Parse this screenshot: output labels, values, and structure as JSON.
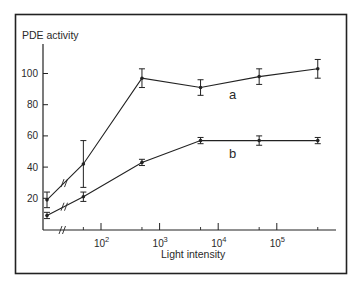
{
  "chart_data": {
    "type": "line",
    "title": "",
    "xlabel": "Light intensity",
    "ylabel": "PDE activity",
    "x_scale": "log (with axis break near origin)",
    "x_tick_labels": [
      "10",
      "10",
      "10",
      "10"
    ],
    "x_tick_exponents": [
      "2",
      "3",
      "4",
      "5"
    ],
    "x": [
      0,
      50,
      500,
      5000,
      50000,
      500000
    ],
    "y_tick_labels": [
      "20",
      "40",
      "60",
      "80",
      "100"
    ],
    "ylim": [
      0,
      115
    ],
    "grid": false,
    "legend": "inline labels a, b",
    "series": [
      {
        "name": "a",
        "values": [
          19,
          42,
          97,
          91,
          98,
          103
        ],
        "errors": [
          5,
          15,
          6,
          5,
          5,
          6
        ]
      },
      {
        "name": "b",
        "values": [
          9,
          21,
          43,
          57,
          57,
          57
        ],
        "errors": [
          2,
          3,
          2,
          2,
          3,
          2
        ]
      }
    ],
    "annotations": [
      "a",
      "b"
    ]
  }
}
